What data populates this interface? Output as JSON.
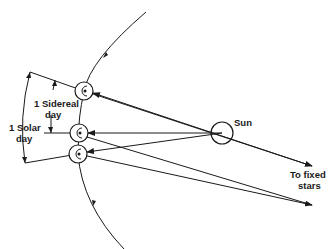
{
  "diagram": {
    "labels": {
      "sun": "Sun",
      "sidereal_line1": "1 Sidereal",
      "sidereal_line2": "day",
      "solar_line1": "1 Solar",
      "solar_line2": "day",
      "fixed_line1": "To fixed",
      "fixed_line2": "stars"
    },
    "colors": {
      "ink": "#1a1a1a",
      "background": "#ffffff"
    }
  }
}
